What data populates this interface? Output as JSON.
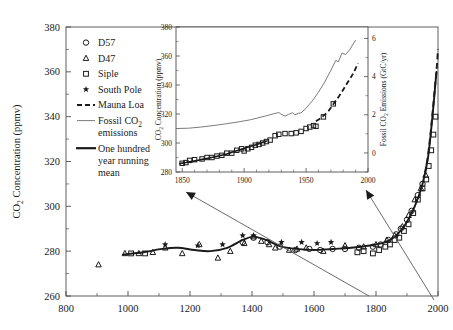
{
  "figure": {
    "name": "co2-concentration-figure"
  },
  "main_axes": {
    "ylabel": "CO2 Concentration (ppmv)",
    "ylabel_parts": {
      "pre": "CO",
      "sub": "2",
      "post": " Concentration (ppmv)"
    },
    "yticks": [
      "260",
      "280",
      "300",
      "320",
      "340",
      "360",
      "380"
    ],
    "xticks": [
      "800",
      "1000",
      "1200",
      "1400",
      "1600",
      "1800",
      "2000"
    ],
    "ylim": [
      260,
      380
    ],
    "xlim": [
      800,
      2000
    ]
  },
  "inset_axes": {
    "ylabel_parts": {
      "pre": "CO",
      "sub": "2",
      "post": " Concentration (ppmv)"
    },
    "y2label_parts": {
      "pre": "Fossil CO",
      "sub": "2",
      "post": " Emissions (GtC/yr)"
    },
    "yticks": [
      "280",
      "300",
      "320",
      "340",
      "360",
      "380"
    ],
    "y2ticks": [
      "0",
      "2",
      "4",
      "6"
    ],
    "xticks": [
      "1850",
      "1900",
      "1950",
      "2000"
    ],
    "ylim": [
      280,
      380
    ],
    "y2lim": [
      -1,
      6.6
    ],
    "xlim": [
      1845,
      2000
    ]
  },
  "legend": {
    "items": [
      {
        "label": "D57",
        "marker": "circle"
      },
      {
        "label": "D47",
        "marker": "triangle"
      },
      {
        "label": "Siple",
        "marker": "square"
      },
      {
        "label": "South Pole",
        "marker": "star"
      },
      {
        "label": "Mauna Loa",
        "marker": "dashed-line"
      },
      {
        "label": "Fossil CO2 emissions",
        "marker": "thin-line",
        "line1_pre": "Fossil CO",
        "line1_sub": "2",
        "line2": "emissions"
      },
      {
        "label": "One hundred year running mean",
        "marker": "thick-line",
        "line1": "One hundred",
        "line2": "year running",
        "line3": "mean"
      }
    ]
  },
  "colors": {
    "ink": "#1a1a1a",
    "thin_line": "#6d6d6d",
    "frame": "#4d4d4d",
    "arrow": "#5a5a5a"
  },
  "chart_data": {
    "type": "scatter",
    "title": "",
    "xlabel": "",
    "ylabel": "CO2 Concentration (ppmv)",
    "xlim": [
      800,
      2000
    ],
    "ylim": [
      260,
      380
    ],
    "grid": false,
    "legend_position": "upper-left",
    "series": [
      {
        "name": "D47",
        "marker": "triangle",
        "points": [
          [
            905,
            274
          ],
          [
            990,
            279
          ],
          [
            1035,
            279
          ],
          [
            1080,
            279.5
          ],
          [
            1120,
            281.5
          ],
          [
            1175,
            279
          ],
          [
            1230,
            283
          ],
          [
            1290,
            277
          ],
          [
            1330,
            280
          ],
          [
            1375,
            283.5
          ],
          [
            1405,
            286.5
          ],
          [
            1430,
            284.5
          ],
          [
            1455,
            283
          ],
          [
            1475,
            281.5
          ],
          [
            1520,
            280.5
          ],
          [
            1545,
            281
          ],
          [
            1575,
            281.5
          ],
          [
            1630,
            280
          ],
          [
            1700,
            282.5
          ],
          [
            1760,
            282
          ],
          [
            1800,
            283
          ],
          [
            1835,
            285
          ],
          [
            1860,
            287
          ],
          [
            1885,
            291
          ],
          [
            1905,
            296
          ],
          [
            1925,
            303
          ],
          [
            1945,
            308
          ],
          [
            1960,
            314
          ]
        ]
      },
      {
        "name": "D57",
        "marker": "circle",
        "points": [
          [
            1370,
            284
          ],
          [
            1405,
            286
          ],
          [
            1450,
            284
          ],
          [
            1490,
            282
          ],
          [
            1540,
            280.5
          ],
          [
            1585,
            281
          ],
          [
            1620,
            280.5
          ],
          [
            1660,
            281
          ],
          [
            1700,
            281
          ],
          [
            1745,
            281.5
          ],
          [
            1790,
            282
          ],
          [
            1815,
            283
          ],
          [
            1840,
            285
          ],
          [
            1865,
            287.5
          ],
          [
            1880,
            290
          ],
          [
            1900,
            294
          ],
          [
            1915,
            298
          ],
          [
            1935,
            305
          ],
          [
            1950,
            310
          ]
        ]
      },
      {
        "name": "Siple",
        "marker": "square",
        "points": [
          [
            1010,
            279
          ],
          [
            1055,
            279
          ],
          [
            1740,
            279.5
          ],
          [
            1760,
            280
          ],
          [
            1790,
            279
          ],
          [
            1810,
            280.5
          ],
          [
            1830,
            282
          ],
          [
            1845,
            283
          ],
          [
            1860,
            285
          ],
          [
            1875,
            286
          ],
          [
            1890,
            289
          ],
          [
            1905,
            292
          ],
          [
            1920,
            297
          ],
          [
            1935,
            303
          ],
          [
            1950,
            308
          ],
          [
            1962,
            312
          ],
          [
            1970,
            318
          ],
          [
            1978,
            325
          ],
          [
            1985,
            332
          ],
          [
            1992,
            340
          ]
        ]
      },
      {
        "name": "South Pole",
        "marker": "star",
        "points": [
          [
            1120,
            283
          ],
          [
            1225,
            282.5
          ],
          [
            1305,
            283
          ],
          [
            1370,
            287
          ],
          [
            1405,
            287
          ],
          [
            1495,
            284
          ],
          [
            1560,
            284
          ],
          [
            1610,
            283.5
          ],
          [
            1655,
            284
          ]
        ]
      },
      {
        "name": "Mauna Loa",
        "marker": "dashed-line",
        "points": [
          [
            1958,
            315
          ],
          [
            1966,
            321
          ],
          [
            1974,
            330
          ],
          [
            1982,
            341
          ],
          [
            1990,
            353
          ],
          [
            1996,
            362
          ],
          [
            2000,
            370
          ]
        ]
      },
      {
        "name": "One hundred year running mean",
        "marker": "thick-line",
        "points": [
          [
            985,
            278.5
          ],
          [
            1050,
            279.5
          ],
          [
            1110,
            281
          ],
          [
            1160,
            281.5
          ],
          [
            1215,
            280.5
          ],
          [
            1265,
            280
          ],
          [
            1320,
            281.5
          ],
          [
            1370,
            285
          ],
          [
            1405,
            286.5
          ],
          [
            1445,
            285
          ],
          [
            1495,
            282
          ],
          [
            1545,
            281
          ],
          [
            1600,
            280.5
          ],
          [
            1660,
            281
          ],
          [
            1720,
            281.5
          ],
          [
            1780,
            282.5
          ],
          [
            1830,
            284
          ],
          [
            1865,
            287
          ],
          [
            1895,
            292
          ],
          [
            1925,
            300
          ],
          [
            1950,
            310
          ],
          [
            1968,
            322
          ],
          [
            1982,
            340
          ],
          [
            1995,
            360
          ]
        ]
      }
    ],
    "inset": {
      "type": "line",
      "xlim": [
        1845,
        2000
      ],
      "ylim": [
        280,
        380
      ],
      "y2lim": [
        -1,
        6.6
      ],
      "series": [
        {
          "name": "Siple",
          "marker": "square",
          "points": [
            [
              1850,
              286
            ],
            [
              1853,
              286.5
            ],
            [
              1856,
              288
            ],
            [
              1860,
              288.5
            ],
            [
              1866,
              289
            ],
            [
              1870,
              290
            ],
            [
              1874,
              290
            ],
            [
              1878,
              291
            ],
            [
              1882,
              291.5
            ],
            [
              1886,
              293
            ],
            [
              1890,
              293
            ],
            [
              1894,
              295
            ],
            [
              1898,
              296
            ],
            [
              1900,
              294.5
            ],
            [
              1903,
              296
            ],
            [
              1906,
              297
            ],
            [
              1909,
              298.5
            ],
            [
              1912,
              299
            ],
            [
              1915,
              300
            ],
            [
              1918,
              301
            ],
            [
              1921,
              302
            ],
            [
              1925,
              305
            ],
            [
              1928,
              306
            ],
            [
              1933,
              306.5
            ],
            [
              1938,
              306.5
            ],
            [
              1942,
              307
            ],
            [
              1946,
              308
            ],
            [
              1950,
              310
            ],
            [
              1953,
              311
            ],
            [
              1956,
              312
            ],
            [
              1958,
              311.5
            ],
            [
              1964,
              318
            ],
            [
              1972,
              327
            ]
          ]
        },
        {
          "name": "One hundred year running mean",
          "marker": "thick-line",
          "points": [
            [
              1848,
              285.8
            ],
            [
              1856,
              287
            ],
            [
              1864,
              288.3
            ],
            [
              1872,
              289.6
            ],
            [
              1880,
              291.2
            ],
            [
              1888,
              293
            ],
            [
              1896,
              295.2
            ],
            [
              1904,
              297.4
            ],
            [
              1912,
              299.5
            ],
            [
              1918,
              301.3
            ]
          ]
        },
        {
          "name": "Mauna Loa",
          "marker": "dashed-line",
          "points": [
            [
              1958,
              315
            ],
            [
              1963,
              318
            ],
            [
              1968,
              322
            ],
            [
              1973,
              328
            ],
            [
              1978,
              334
            ],
            [
              1983,
              341
            ],
            [
              1988,
              348
            ],
            [
              1992,
              355
            ]
          ]
        },
        {
          "name": "Fossil CO2 emissions",
          "marker": "thin-line",
          "axis": "right",
          "points": [
            [
              1846,
              310
            ],
            [
              1855,
              310.2
            ],
            [
              1865,
              311
            ],
            [
              1875,
              312
            ],
            [
              1885,
              313.2
            ],
            [
              1895,
              314.5
            ],
            [
              1905,
              316
            ],
            [
              1912,
              317.5
            ],
            [
              1918,
              318.8
            ],
            [
              1924,
              320.2
            ],
            [
              1928,
              321
            ],
            [
              1930,
              319.8
            ],
            [
              1933,
              318.5
            ],
            [
              1936,
              319.8
            ],
            [
              1939,
              320.8
            ],
            [
              1941,
              319.5
            ],
            [
              1944,
              320.5
            ],
            [
              1946,
              320.8
            ],
            [
              1950,
              324
            ],
            [
              1955,
              329
            ],
            [
              1960,
              335
            ],
            [
              1965,
              342
            ],
            [
              1970,
              350
            ],
            [
              1974,
              357
            ],
            [
              1976,
              356
            ],
            [
              1979,
              362
            ],
            [
              1982,
              361
            ],
            [
              1985,
              364
            ],
            [
              1990,
              371
            ]
          ]
        }
      ]
    }
  },
  "annotations": {
    "arrows": [
      {
        "name": "arrow-to-inset-left",
        "from": [
          369,
          296
        ],
        "to": [
          186,
          192
        ]
      },
      {
        "name": "arrow-to-inset-right",
        "from": [
          434,
          300
        ],
        "to": [
          366,
          190
        ]
      }
    ]
  }
}
